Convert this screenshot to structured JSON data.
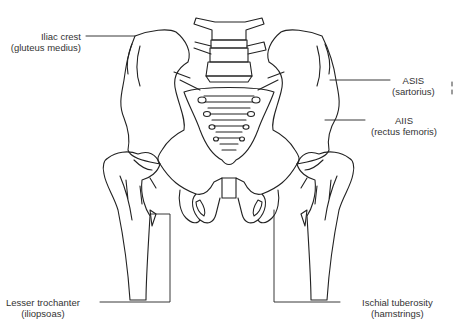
{
  "figure": {
    "labels": [
      {
        "id": "iliac-crest",
        "name": "Iliac crest",
        "muscle": "(gluteus medius)"
      },
      {
        "id": "asis",
        "name": "ASIS",
        "muscle": "(sartorius)"
      },
      {
        "id": "aiis",
        "name": "AIIS",
        "muscle": "(rectus femoris)"
      },
      {
        "id": "lesser-trochanter",
        "name": "Lesser trochanter",
        "muscle": "(iliopsoas)"
      },
      {
        "id": "ischial-tuberosity",
        "name": "Ischial tuberosity",
        "muscle": "(hamstrings)"
      }
    ],
    "line_color": "#222222",
    "background": "#ffffff"
  }
}
